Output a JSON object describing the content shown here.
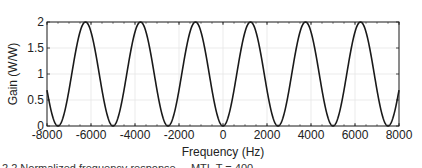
{
  "chart_data": {
    "type": "line",
    "title": "",
    "xlabel": "Frequency (Hz)",
    "ylabel": "Gain (W/W)",
    "xlim": [
      -8000,
      8000
    ],
    "ylim": [
      0,
      2
    ],
    "xticks": [
      -8000,
      -6000,
      -4000,
      -2000,
      0,
      2000,
      4000,
      6000,
      8000
    ],
    "xtick_labels": [
      "-8000",
      "-6000",
      "-4000",
      "-2000",
      "0",
      "2000",
      "4000",
      "6000",
      "8000"
    ],
    "yticks": [
      0,
      0.5,
      1,
      1.5,
      2
    ],
    "ytick_labels": [
      "0",
      "0.5",
      "1",
      "1.5",
      "2"
    ],
    "grid": true,
    "legend": null,
    "series": [
      {
        "name": "Gain",
        "formula": "1 - cos(2*pi*f/2500)",
        "period_hz": 2500,
        "color": "#1a1a1a",
        "minima_x": [
          -7500,
          -5000,
          -2500,
          0,
          2500,
          5000,
          7500
        ],
        "maxima_x": [
          -6250,
          -3750,
          -1250,
          1250,
          3750,
          6250
        ],
        "x": [
          -8000,
          -7500,
          -6875,
          -6250,
          -5625,
          -5000,
          -4375,
          -3750,
          -3125,
          -2500,
          -1875,
          -1250,
          -625,
          0,
          625,
          1250,
          1875,
          2500,
          3125,
          3750,
          4375,
          5000,
          5625,
          6250,
          6875,
          7500,
          8000
        ],
        "y": [
          0.69,
          0,
          1,
          2,
          1,
          0,
          1,
          2,
          1,
          0,
          1,
          2,
          1,
          0,
          1,
          2,
          1,
          0,
          1,
          2,
          1,
          0,
          1,
          2,
          1,
          0,
          0.69
        ]
      }
    ]
  },
  "caption": "2.2   Normalized frequency response ... MTI, T = 400 ..."
}
